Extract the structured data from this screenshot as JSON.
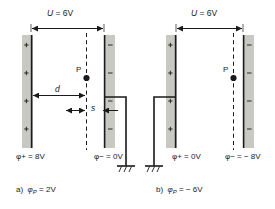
{
  "figure": {
    "type": "physics-diagram",
    "colors": {
      "plate_fill": "#c9c9c4",
      "line": "#1a1a1a",
      "background": "#ffffff"
    }
  },
  "panel_a": {
    "voltage_label": "U = 6V",
    "voltage_symbol": "U",
    "voltage_value": "= 6V",
    "plate_left_label": "φ+ = 8V",
    "plate_left_sign": "+",
    "plate_right_label": "φ− = 0V",
    "plate_right_sign": "−",
    "point_label": "P",
    "dim_d": "d",
    "dim_s": "s",
    "caption_index": "a)",
    "caption_text": "φP = 2V",
    "caption_symbol": "φ",
    "caption_sub": "P",
    "caption_value": "= 2V",
    "ground": "ground-symbol"
  },
  "panel_b": {
    "voltage_label": "U = 6V",
    "voltage_symbol": "U",
    "voltage_value": "= 6V",
    "plate_left_label": "φ+ = 0V",
    "plate_left_sign": "+",
    "plate_right_label": "φ− = − 8V",
    "plate_right_sign": "−",
    "point_label": "P",
    "caption_index": "b)",
    "caption_text": "φP = −6V",
    "caption_symbol": "φ",
    "caption_sub": "P",
    "caption_value": "= − 6V",
    "ground": "ground-symbol"
  }
}
